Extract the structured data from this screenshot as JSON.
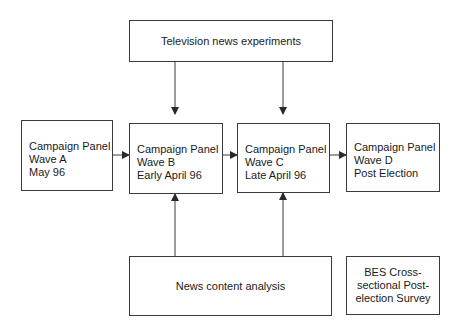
{
  "diagram": {
    "nodes": {
      "tv": {
        "label": "Television news experiments"
      },
      "wave_a": {
        "lines": [
          "Campaign Panel",
          "Wave A",
          "May 96"
        ]
      },
      "wave_b": {
        "lines": [
          "Campaign Panel",
          "Wave B",
          "Early April 96"
        ]
      },
      "wave_c": {
        "lines": [
          "Campaign Panel",
          "Wave C",
          "Late April 96"
        ]
      },
      "wave_d": {
        "lines": [
          "Campaign Panel",
          "Wave D",
          "Post Election"
        ]
      },
      "news": {
        "label": "News content analysis"
      },
      "bes": {
        "lines": [
          "BES Cross-",
          "sectional Post-",
          "election Survey"
        ]
      }
    },
    "edges": [
      {
        "from": "wave_a",
        "to": "wave_b"
      },
      {
        "from": "wave_b",
        "to": "wave_c"
      },
      {
        "from": "wave_c",
        "to": "wave_d"
      },
      {
        "from": "tv",
        "to": "wave_b"
      },
      {
        "from": "tv",
        "to": "wave_c"
      },
      {
        "from": "news",
        "to": "wave_b"
      },
      {
        "from": "news",
        "to": "wave_c"
      }
    ],
    "colors": {
      "line": "#3a3a3a",
      "text": "#1a1a1a",
      "background": "#ffffff"
    }
  }
}
